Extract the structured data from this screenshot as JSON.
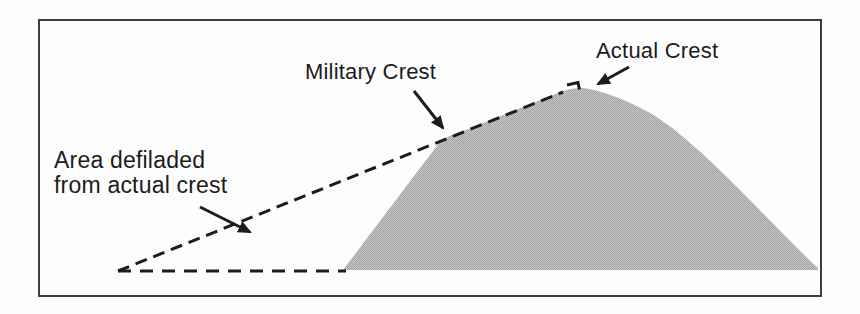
{
  "diagram": {
    "type": "terrain-profile-figure",
    "labels": {
      "actual_crest": "Actual Crest",
      "military_crest": "Military Crest",
      "area_defiladed_line1": "Area defiladed",
      "area_defiladed_line2": "from actual crest"
    },
    "colors": {
      "hill_base": "#c6c6c6",
      "hill_dot": "#a3a3a3",
      "hill_average": "#b5b5b5",
      "line": "#1c1c1c",
      "frame_border": "#3c3c3c",
      "background": "#fdfdfd"
    }
  }
}
